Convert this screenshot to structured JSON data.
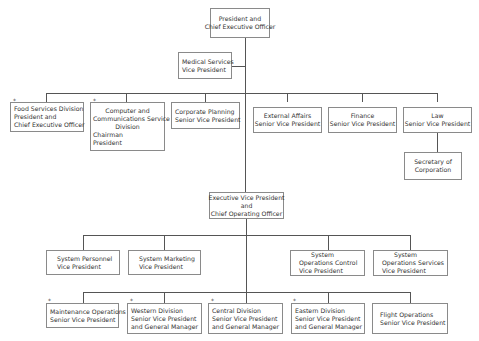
{
  "chart": {
    "ceo": [
      "President and",
      "Chief Executive Officer"
    ],
    "medical": [
      "Medical Services",
      "Vice President"
    ],
    "row1": [
      {
        "lines": [
          "Food Services Division",
          "President and",
          "Chief Executive Officer"
        ],
        "starred": true
      },
      {
        "lines": [
          "Computer and",
          "Communications Service",
          "Division",
          "Chairman",
          "President"
        ],
        "starred": true
      },
      {
        "lines": [
          "Corporate Planning",
          "Senior Vice President"
        ],
        "starred": false
      },
      {
        "lines": [
          "External Affairs",
          "Senior Vice President"
        ],
        "starred": false
      },
      {
        "lines": [
          "Finance",
          "Senior Vice President"
        ],
        "starred": false
      },
      {
        "lines": [
          "Law",
          "Senior Vice President"
        ],
        "starred": false
      }
    ],
    "secretary": [
      "Secretary of",
      "Corporation"
    ],
    "evp": [
      "Executive Vice President",
      "and",
      "Chief Operating Officer"
    ],
    "row3": [
      {
        "lines": [
          "System Personnel",
          "Vice President"
        ]
      },
      {
        "lines": [
          "System Marketing",
          "Vice President"
        ]
      },
      {
        "lines": [
          "System",
          "Operations Control",
          "Vice President"
        ]
      },
      {
        "lines": [
          "System",
          "Operations Services",
          "Vice President"
        ]
      }
    ],
    "row4": [
      {
        "lines": [
          "Maintenance Operations",
          "Senior Vice President"
        ],
        "starred": true
      },
      {
        "lines": [
          "Western Division",
          "Senior Vice President",
          "and General Manager"
        ],
        "starred": true
      },
      {
        "lines": [
          "Central Division",
          "Senior Vice President",
          "and General Manager"
        ],
        "starred": true
      },
      {
        "lines": [
          "Eastern Division",
          "Senior Vice President",
          "and General Manager"
        ],
        "starred": true
      },
      {
        "lines": [
          "Flight Operations",
          "Senior Vice President"
        ],
        "starred": false
      }
    ],
    "star_symbol": "*"
  }
}
